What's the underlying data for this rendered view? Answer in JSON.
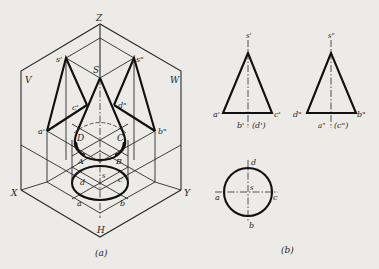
{
  "figure_a": {
    "caption": "(a)",
    "plane_labels": {
      "V": "V",
      "W": "W",
      "H": "H"
    },
    "axis_labels": {
      "X": "X",
      "Y": "Y",
      "Z": "Z"
    },
    "points": {
      "S": "S",
      "s_prime": "s'",
      "s_double": "s\"",
      "a_prime": "a'",
      "b_double": "b\"",
      "c_prime": "c'",
      "d_double": "d\"",
      "A": "A",
      "B": "B",
      "C": "C",
      "D": "D",
      "a": "a",
      "b": "b",
      "c": "c",
      "d": "d",
      "s": "s"
    }
  },
  "figure_b": {
    "caption": "(b)",
    "front_view": {
      "apex": "s'",
      "left": "a'",
      "right": "c'",
      "center1": "b'",
      "center2": "(d')"
    },
    "side_view": {
      "apex": "s\"",
      "left": "d\"",
      "right": "b\"",
      "center1": "a\"",
      "center2": "(c\")"
    },
    "top_view": {
      "top": "d",
      "bottom": "b",
      "left": "a",
      "right": "c",
      "center": "s"
    }
  },
  "colors": {
    "background": "#ecebe8",
    "ink": "#111111"
  }
}
